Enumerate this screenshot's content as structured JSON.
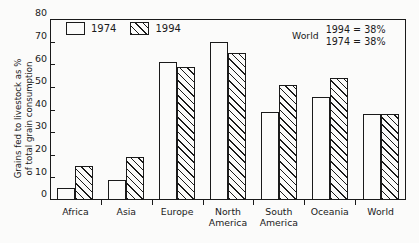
{
  "chart_data": {
    "type": "bar",
    "title": "",
    "xlabel": "",
    "ylabel": "Grains fed to livestock as %\nof total grain consumption",
    "ylim": [
      0,
      80
    ],
    "yticks": [
      0,
      10,
      20,
      30,
      40,
      50,
      60,
      70,
      80
    ],
    "grid": false,
    "legend_position": "top-left",
    "categories": [
      "Africa",
      "Asia",
      "Europe",
      "North\nAmerica",
      "South\nAmerica",
      "Oceania",
      "World"
    ],
    "series": [
      {
        "name": "1974",
        "values": [
          5.5,
          9,
          61,
          70,
          39,
          45.5,
          38
        ]
      },
      {
        "name": "1994",
        "values": [
          15,
          19,
          59,
          65,
          51,
          54,
          38
        ]
      }
    ],
    "annotations": [
      {
        "label": "World",
        "lines": [
          "1994 = 38%",
          "1974 = 38%"
        ]
      }
    ],
    "colors": {
      "axis": "#1a1a1a",
      "bar_1974_fill": "#fbfbfa",
      "bar_1994_fill": "#fbfbfa",
      "bar_1994_hatch": "#1a1a1a",
      "background": "#fbfbfa"
    }
  }
}
